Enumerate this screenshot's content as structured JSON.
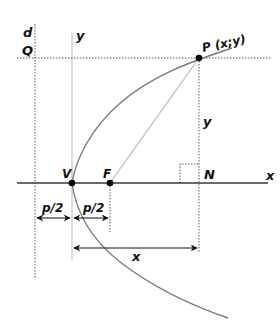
{
  "diagram": {
    "colors": {
      "curve": "#7a7a7a",
      "axis": "#3a3a3a",
      "yaxis": "#c8c8c8",
      "focal_segment": "#c8c8c8",
      "dotted": "#555555",
      "point": "#000000",
      "text": "#111111"
    },
    "labels": {
      "directrix": "d",
      "Q": "Q",
      "y_axis": "y",
      "P": "P (x;y)",
      "y_distance": "y",
      "V": "V",
      "F": "F",
      "N": "N",
      "x_axis": "x",
      "p_half_left": "p/2",
      "p_half_right": "p/2",
      "x_distance": "x"
    },
    "points": {
      "V": [
        72,
        183
      ],
      "F": [
        110,
        183
      ],
      "P": [
        199,
        58
      ],
      "N": [
        199,
        183
      ]
    }
  }
}
